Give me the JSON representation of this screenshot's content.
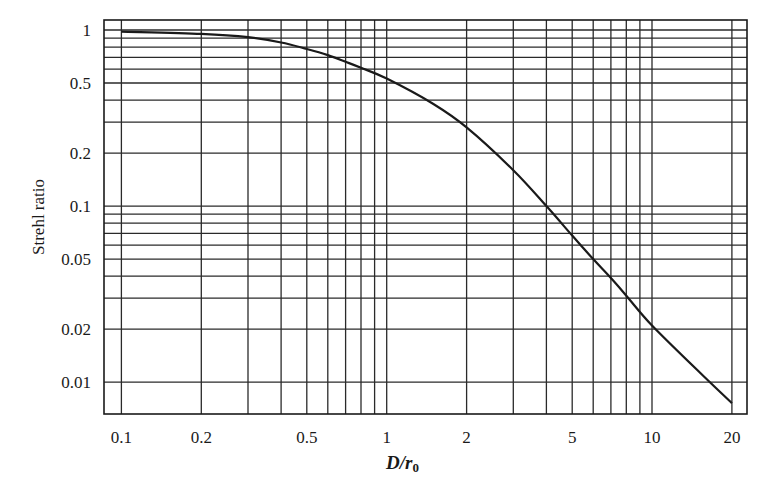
{
  "chart_data": {
    "type": "line",
    "title": "",
    "xlabel": "D/r0",
    "xlabel_main": "D/r",
    "xlabel_sub": "0",
    "ylabel": "Strehl ratio",
    "xscale": "log",
    "yscale": "log",
    "xlim": [
      0.086,
      22.8
    ],
    "ylim": [
      0.0066,
      1.14
    ],
    "grid": true,
    "legend": null,
    "x_ticks": [
      0.1,
      0.2,
      0.5,
      1,
      2,
      5,
      10,
      20
    ],
    "x_tick_labels": [
      "0.1",
      "0.2",
      "0.5",
      "1",
      "2",
      "5",
      "10",
      "20"
    ],
    "y_ticks": [
      1,
      0.5,
      0.2,
      0.1,
      0.05,
      0.02,
      0.01
    ],
    "y_tick_labels": [
      "1",
      "0.5",
      "0.2",
      "0.1",
      "0.05",
      "0.02",
      "0.01"
    ],
    "x_gridlines": [
      0.1,
      0.2,
      0.3,
      0.4,
      0.5,
      0.6,
      0.7,
      0.8,
      0.9,
      1,
      2,
      3,
      4,
      5,
      6,
      7,
      8,
      9,
      10,
      20
    ],
    "y_gridlines": [
      1,
      0.9,
      0.8,
      0.7,
      0.6,
      0.5,
      0.4,
      0.3,
      0.2,
      0.1,
      0.09,
      0.08,
      0.07,
      0.06,
      0.05,
      0.04,
      0.03,
      0.02,
      0.01
    ],
    "series": [
      {
        "name": "Strehl ratio vs D/r0",
        "x": [
          0.1,
          0.2,
          0.3,
          0.4,
          0.5,
          0.6,
          0.7,
          0.8,
          1,
          1.5,
          2,
          3,
          4,
          5,
          6,
          7,
          8,
          10,
          15,
          20
        ],
        "y": [
          0.98,
          0.95,
          0.91,
          0.85,
          0.78,
          0.72,
          0.66,
          0.61,
          0.53,
          0.38,
          0.28,
          0.16,
          0.1,
          0.068,
          0.05,
          0.039,
          0.031,
          0.021,
          0.0115,
          0.0076
        ]
      }
    ]
  },
  "layout": {
    "plot": {
      "left": 104,
      "top": 20,
      "right": 747,
      "bottom": 414
    },
    "colors": {
      "line": "#1a1a1a",
      "grid": "#2a2a2a",
      "frame": "#1a1a1a",
      "background": "#ffffff"
    }
  }
}
